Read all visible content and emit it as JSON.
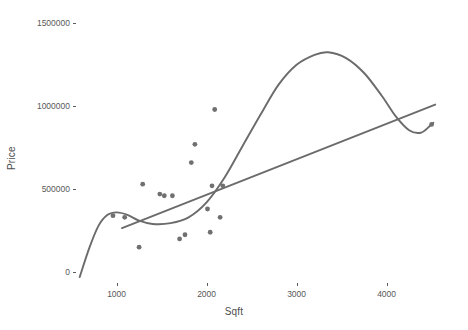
{
  "chart_data": {
    "type": "scatter",
    "title": "",
    "xlabel": "Sqft",
    "ylabel": "Price",
    "xlim": [
      560,
      4560
    ],
    "ylim": [
      -60000,
      1580000
    ],
    "x_ticks": [
      1000,
      2000,
      3000,
      4000
    ],
    "x_tick_labels": [
      "1000",
      "2000",
      "3000",
      "4000"
    ],
    "y_ticks": [
      0,
      500000,
      1000000,
      1500000
    ],
    "y_tick_labels": [
      "0",
      "500000",
      "1000000",
      "1500000"
    ],
    "grid": false,
    "legend": "none",
    "point_color": "#707070",
    "line_color": "#6b6b6b",
    "points": [
      {
        "x": 960,
        "y": 340000
      },
      {
        "x": 1090,
        "y": 330000
      },
      {
        "x": 1250,
        "y": 150000
      },
      {
        "x": 1290,
        "y": 530000
      },
      {
        "x": 1480,
        "y": 470000
      },
      {
        "x": 1530,
        "y": 460000
      },
      {
        "x": 1620,
        "y": 460000
      },
      {
        "x": 1700,
        "y": 200000
      },
      {
        "x": 1760,
        "y": 225000
      },
      {
        "x": 1830,
        "y": 660000
      },
      {
        "x": 1870,
        "y": 770000
      },
      {
        "x": 2010,
        "y": 380000
      },
      {
        "x": 2040,
        "y": 240000
      },
      {
        "x": 2060,
        "y": 520000
      },
      {
        "x": 2090,
        "y": 980000
      },
      {
        "x": 2150,
        "y": 330000
      },
      {
        "x": 2180,
        "y": 520000
      },
      {
        "x": 4500,
        "y": 890000
      }
    ],
    "series": [
      {
        "name": "loess",
        "type": "smooth",
        "points": [
          {
            "x": 590,
            "y": -30000
          },
          {
            "x": 700,
            "y": 150000
          },
          {
            "x": 800,
            "y": 280000
          },
          {
            "x": 900,
            "y": 345000
          },
          {
            "x": 1000,
            "y": 360000
          },
          {
            "x": 1120,
            "y": 345000
          },
          {
            "x": 1250,
            "y": 310000
          },
          {
            "x": 1400,
            "y": 290000
          },
          {
            "x": 1600,
            "y": 295000
          },
          {
            "x": 1800,
            "y": 330000
          },
          {
            "x": 2000,
            "y": 420000
          },
          {
            "x": 2200,
            "y": 570000
          },
          {
            "x": 2400,
            "y": 760000
          },
          {
            "x": 2600,
            "y": 950000
          },
          {
            "x": 2800,
            "y": 1130000
          },
          {
            "x": 3000,
            "y": 1250000
          },
          {
            "x": 3200,
            "y": 1310000
          },
          {
            "x": 3350,
            "y": 1325000
          },
          {
            "x": 3550,
            "y": 1290000
          },
          {
            "x": 3750,
            "y": 1200000
          },
          {
            "x": 3950,
            "y": 1060000
          },
          {
            "x": 4100,
            "y": 940000
          },
          {
            "x": 4250,
            "y": 855000
          },
          {
            "x": 4380,
            "y": 840000
          },
          {
            "x": 4480,
            "y": 880000
          },
          {
            "x": 4520,
            "y": 900000
          }
        ]
      },
      {
        "name": "linear-fit",
        "type": "line",
        "points": [
          {
            "x": 1060,
            "y": 265000
          },
          {
            "x": 4540,
            "y": 1010000
          }
        ]
      }
    ]
  }
}
